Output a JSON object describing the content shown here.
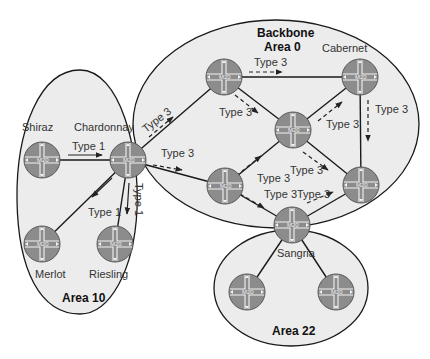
{
  "diagram": {
    "type": "OSPF multi-area topology",
    "colors": {
      "area_fill": "#ececec",
      "router_fill": "#8c8c8c",
      "line": "#1a1a1a"
    },
    "areas": [
      {
        "id": "area10",
        "label": "Area 10"
      },
      {
        "id": "backbone",
        "label_line1": "Backbone",
        "label_line2": "Area 0"
      },
      {
        "id": "area22",
        "label": "Area 22"
      }
    ],
    "routers": [
      {
        "id": "shiraz",
        "name": "Shiraz",
        "model": "M20",
        "area": "Area 10"
      },
      {
        "id": "chardonnay",
        "name": "Chardonnay",
        "model": "M20",
        "area": "Area 10 / Area 0"
      },
      {
        "id": "merlot",
        "name": "Merlot",
        "model": "M20",
        "area": "Area 10"
      },
      {
        "id": "riesling",
        "name": "Riesling",
        "model": "M20",
        "area": "Area 10"
      },
      {
        "id": "bb-top-left",
        "name": "",
        "model": "M20",
        "area": "Area 0"
      },
      {
        "id": "cabernet",
        "name": "Cabernet",
        "model": "M20",
        "area": "Area 0"
      },
      {
        "id": "bb-middle",
        "name": "",
        "model": "M20",
        "area": "Area 0"
      },
      {
        "id": "bb-bottom-left",
        "name": "",
        "model": "M20",
        "area": "Area 0"
      },
      {
        "id": "bb-bottom-right",
        "name": "",
        "model": "M20",
        "area": "Area 0"
      },
      {
        "id": "sangria",
        "name": "Sangria",
        "model": "M20",
        "area": "Area 0 / Area 22"
      },
      {
        "id": "a22-left",
        "name": "",
        "model": "M20",
        "area": "Area 22"
      },
      {
        "id": "a22-right",
        "name": "",
        "model": "M20",
        "area": "Area 22"
      }
    ],
    "lsa_labels": {
      "shiraz_to_chardonnay": "Type 1",
      "chardonnay_to_merlot": "Type 1",
      "chardonnay_to_riesling": "Type 1",
      "chardonnay_to_bb_top_left": "Type 3",
      "chardonnay_to_bb_bottom_left": "Type 3",
      "bb_top_left_to_cabernet": "Type 3",
      "bb_top_left_to_middle": "Type 3",
      "middle_to_cabernet": "Type 3",
      "cabernet_to_bottom_right": "Type 3",
      "bottom_left_to_middle": "Type 3",
      "middle_to_bottom_right": "Type 3",
      "bottom_left_to_sangria": "Type 3",
      "sangria_to_bottom_right": "Type 3"
    }
  }
}
